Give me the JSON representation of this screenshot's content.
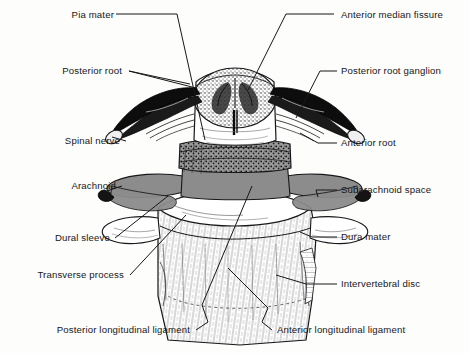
{
  "figure": {
    "background_color": "#fdfdfb",
    "ink_color": "#17171a",
    "gray_fill": "#8c8c8c",
    "light_fill": "#ffffff",
    "labels_left": [
      {
        "id": "pia-mater",
        "text": "Pia mater"
      },
      {
        "id": "posterior-root",
        "text": "Posterior root"
      },
      {
        "id": "spinal-nerve",
        "text": "Spinal nerve"
      },
      {
        "id": "arachnoid",
        "text": "Arachnoid"
      },
      {
        "id": "dural-sleeve",
        "text": "Dural sleeve"
      },
      {
        "id": "transverse-process",
        "text": "Transverse process"
      },
      {
        "id": "posterior-longitudinal-ligament",
        "text": "Posterior longitudinal ligament"
      }
    ],
    "labels_right": [
      {
        "id": "anterior-median-fissure",
        "text": "Anterior median fissure"
      },
      {
        "id": "posterior-root-ganglion",
        "text": "Posterior root ganglion"
      },
      {
        "id": "anterior-root",
        "text": "Anterior root"
      },
      {
        "id": "subarachnoid-space",
        "text": "Subarachnoid space"
      },
      {
        "id": "dura-mater",
        "text": "Dura mater"
      },
      {
        "id": "intervertebral-disc",
        "text": "Intervertebral disc"
      },
      {
        "id": "anterior-longitudinal-ligament",
        "text": "Anterior longitudinal ligament"
      }
    ]
  }
}
